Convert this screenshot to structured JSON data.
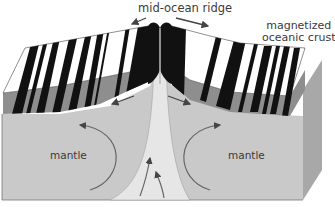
{
  "diagram": {
    "labels": {
      "ridge": "mid-ocean ridge",
      "crust_line1": "magnetized",
      "crust_line2": "oceanic crust",
      "mantle_left": "mantle",
      "mantle_right": "mantle"
    },
    "colors": {
      "stripe_dark": "#111111",
      "stripe_light": "#ffffff",
      "crust_side": "#8e8e8e",
      "mantle": "#c9c9c9",
      "mantle_side": "#a8a8a8",
      "upwelling": "#e6e6e6",
      "arrow": "#555555",
      "text": "#3a3a3a"
    },
    "elements": [
      "magnetized-crust-left-block",
      "magnetized-crust-right-block",
      "ridge-crest",
      "mantle-block",
      "magma-upwelling",
      "convection-arrow-left",
      "convection-arrow-right",
      "spreading-arrows"
    ]
  }
}
